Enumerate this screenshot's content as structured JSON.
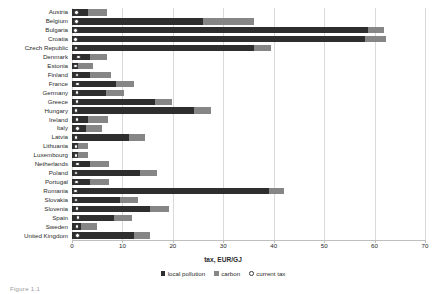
{
  "chart_data": {
    "type": "bar",
    "orientation": "horizontal",
    "stacked": true,
    "title": "",
    "xlabel": "tax, EUR/GJ",
    "ylabel": "",
    "xlim": [
      0,
      70
    ],
    "xticks": [
      0,
      10,
      20,
      30,
      40,
      50,
      60,
      70
    ],
    "grid": true,
    "grid_axis": "x",
    "legend_position": "bottom",
    "categories": [
      "Austria",
      "Belgium",
      "Bulgaria",
      "Croatia",
      "Czech Republic",
      "Denmark",
      "Estonia",
      "Finland",
      "France",
      "Germany",
      "Greece",
      "Hungary",
      "Ireland",
      "Italy",
      "Latvia",
      "Lithuania",
      "Luxembourg",
      "Netherlands",
      "Poland",
      "Portugal",
      "Romania",
      "Slovakia",
      "Slovenia",
      "Spain",
      "Sweden",
      "United Kingdom"
    ],
    "series": [
      {
        "name": "local pollution",
        "color": "#2e2e2e",
        "values": [
          3.2,
          25.9,
          58.6,
          58.2,
          36.0,
          3.6,
          1.2,
          3.6,
          8.7,
          6.7,
          16.4,
          24.2,
          3.2,
          2.8,
          11.3,
          1.2,
          1.2,
          3.5,
          13.4,
          3.6,
          39.0,
          9.5,
          15.4,
          8.3,
          1.8,
          12.3
        ]
      },
      {
        "name": "carbon",
        "color": "#868686",
        "values": [
          3.7,
          10.1,
          3.2,
          4.0,
          3.4,
          3.3,
          3.0,
          4.1,
          3.6,
          3.6,
          3.4,
          3.3,
          3.9,
          3.2,
          3.1,
          1.9,
          2.0,
          3.8,
          3.4,
          3.7,
          3.0,
          3.6,
          3.8,
          3.6,
          3.2,
          3.1
        ]
      },
      {
        "name": "current tax",
        "color": "#ffffff",
        "marker": "open-circle",
        "values": [
          0.9,
          0.9,
          0.7,
          0.7,
          0.8,
          1.3,
          0.7,
          1.0,
          1.1,
          1.0,
          1.0,
          0.8,
          1.0,
          1.1,
          0.8,
          0.8,
          0.8,
          1.1,
          0.8,
          0.9,
          0.7,
          0.8,
          1.0,
          1.2,
          1.0,
          1.1
        ]
      }
    ]
  },
  "axis": {
    "tick_labels": [
      "0",
      "10",
      "20",
      "30",
      "40",
      "50",
      "60",
      "70"
    ],
    "title": "tax, EUR/GJ"
  },
  "legend": {
    "items": [
      {
        "label": "local pollution",
        "kind": "local"
      },
      {
        "label": "carbon",
        "kind": "carbon"
      },
      {
        "label": "current tax",
        "kind": "current"
      }
    ]
  },
  "caption": {
    "text": "Figure 1.1"
  }
}
